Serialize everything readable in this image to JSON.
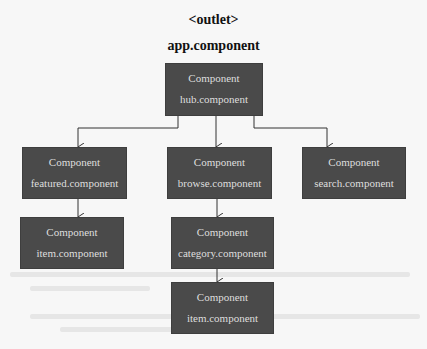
{
  "diagram": {
    "outlet_label": "<outlet>",
    "root_label": "app.component",
    "colors": {
      "box_fill": "#4a4a4a",
      "box_text": "#dedede",
      "line": "#333333",
      "background": "#f7f7f7"
    },
    "nodes": {
      "hub": {
        "type": "Component",
        "name": "hub.component"
      },
      "featured": {
        "type": "Component",
        "name": "featured.component"
      },
      "browse": {
        "type": "Component",
        "name": "browse.component"
      },
      "search": {
        "type": "Component",
        "name": "search.component"
      },
      "featured_item": {
        "type": "Component",
        "name": "item.component"
      },
      "category": {
        "type": "Component",
        "name": "category.component"
      },
      "category_item": {
        "type": "Component",
        "name": "item.component"
      }
    },
    "edges": [
      {
        "from": "hub",
        "to": "featured"
      },
      {
        "from": "hub",
        "to": "browse"
      },
      {
        "from": "hub",
        "to": "search"
      },
      {
        "from": "featured",
        "to": "featured_item"
      },
      {
        "from": "browse",
        "to": "category"
      },
      {
        "from": "category",
        "to": "category_item"
      }
    ]
  }
}
